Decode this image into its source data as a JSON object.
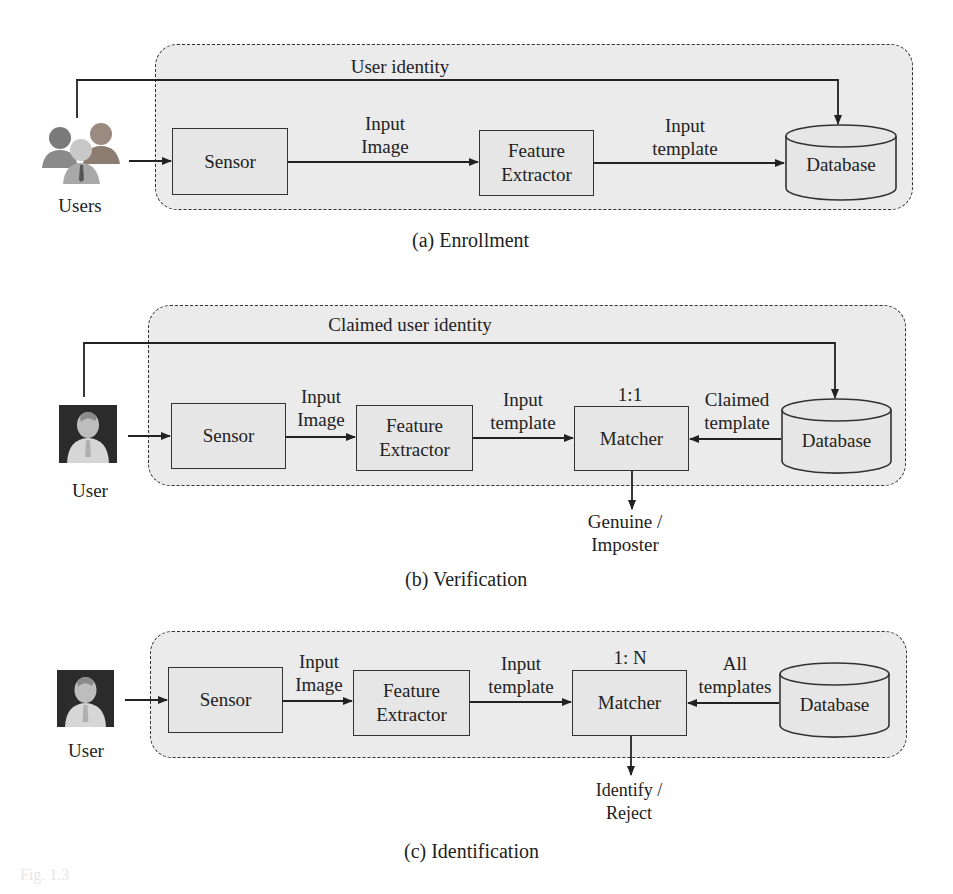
{
  "figure": {
    "panels": [
      {
        "id": "a",
        "caption": "(a)  Enrollment",
        "actor_label": "Users",
        "actor_icon": "users-group-icon",
        "identity_label": "User identity",
        "blocks": {
          "sensor": "Sensor",
          "feature_extractor": [
            "Feature",
            "Extractor"
          ],
          "database": "Database"
        },
        "edges": {
          "sensor_to_fe": [
            "Input",
            "Image"
          ],
          "fe_to_next": [
            "Input",
            "template"
          ]
        }
      },
      {
        "id": "b",
        "caption": "(b)  Verification",
        "actor_label": "User",
        "actor_icon": "user-portrait-icon",
        "identity_label": "Claimed user identity",
        "blocks": {
          "sensor": "Sensor",
          "feature_extractor": [
            "Feature",
            "Extractor"
          ],
          "matcher": "Matcher",
          "matcher_mode": "1:1",
          "database": "Database"
        },
        "edges": {
          "sensor_to_fe": [
            "Input",
            "Image"
          ],
          "fe_to_next": [
            "Input",
            "template"
          ],
          "db_to_matcher": [
            "Claimed",
            "template"
          ]
        },
        "output": [
          "Genuine /",
          "Imposter"
        ]
      },
      {
        "id": "c",
        "caption": "(c)  Identification",
        "actor_label": "User",
        "actor_icon": "user-portrait-icon",
        "blocks": {
          "sensor": "Sensor",
          "feature_extractor": [
            "Feature",
            "Extractor"
          ],
          "matcher": "Matcher",
          "matcher_mode": "1: N",
          "database": "Database"
        },
        "edges": {
          "sensor_to_fe": [
            "Input",
            "Image"
          ],
          "fe_to_next": [
            "Input",
            "template"
          ],
          "db_to_matcher": [
            "All",
            "templates"
          ]
        },
        "output": [
          "Identify /",
          "Reject"
        ]
      }
    ],
    "colors": {
      "panel_fill": "#ebebeb",
      "stroke": "#333333",
      "text": "#222222"
    }
  }
}
